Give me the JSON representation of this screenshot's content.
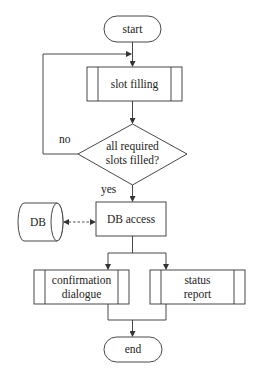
{
  "diagram": {
    "type": "flowchart",
    "nodes": {
      "start": {
        "label": "start",
        "shape": "terminal"
      },
      "slot_filling": {
        "label": "slot filling",
        "shape": "predefined-process"
      },
      "decision": {
        "line1": "all required",
        "line2": "slots filled?",
        "shape": "decision"
      },
      "db_access": {
        "label": "DB access",
        "shape": "process"
      },
      "db": {
        "label": "DB",
        "shape": "database"
      },
      "confirmation": {
        "line1": "confirmation",
        "line2": "dialogue",
        "shape": "predefined-process"
      },
      "status": {
        "line1": "status",
        "line2": "report",
        "shape": "predefined-process"
      },
      "end": {
        "label": "end",
        "shape": "terminal"
      }
    },
    "edges": {
      "no_label": "no",
      "yes_label": "yes"
    },
    "colors": {
      "stroke": "#333333",
      "background": "#ffffff",
      "text": "#222222"
    }
  }
}
